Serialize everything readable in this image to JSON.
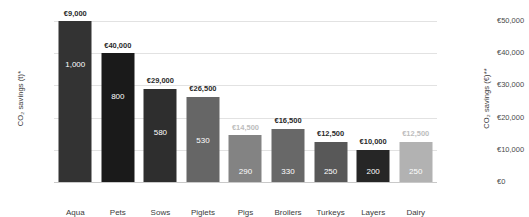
{
  "chart_data": {
    "type": "bar",
    "title": "",
    "xlabel": "",
    "ylabel": "CO₂ savings (t)*",
    "ylabel_secondary": "CO₂ savings (€)**",
    "ylim": [
      0,
      1000
    ],
    "ylim_secondary": [
      0,
      50000
    ],
    "grid": true,
    "legend": "none",
    "yticks": [
      "0",
      "200",
      "400",
      "600",
      "800",
      "1,000"
    ],
    "ytick_values": [
      0,
      200,
      400,
      600,
      800,
      1000
    ],
    "yticks_secondary": [
      "€0",
      "€10,000",
      "€20,000",
      "€30,000",
      "€40,000",
      "€50,000"
    ],
    "ytick_values_secondary": [
      0,
      10000,
      20000,
      30000,
      40000,
      50000
    ],
    "categories": [
      "Aqua",
      "Pets",
      "Sows",
      "Piglets",
      "Pigs",
      "Broilers",
      "Turkeys",
      "Layers",
      "Dairy"
    ],
    "values": [
      1000,
      800,
      580,
      530,
      290,
      330,
      250,
      200,
      250
    ],
    "value_labels": [
      "1,000",
      "800",
      "580",
      "530",
      "290",
      "330",
      "250",
      "200",
      "250"
    ],
    "euro_values": [
      9000,
      40000,
      29000,
      26500,
      14500,
      16500,
      12500,
      10000,
      12500
    ],
    "euro_labels": [
      "€9,000",
      "€40,000",
      "€29,000",
      "€26,500",
      "€14,500",
      "€16,500",
      "€12,500",
      "€10,000",
      "€12,500"
    ],
    "euro_label_faded": [
      false,
      false,
      false,
      false,
      true,
      false,
      false,
      false,
      true
    ],
    "bar_colors": [
      "#333333",
      "#1a1a1a",
      "#2e2e2e",
      "#666666",
      "#838383",
      "#686868",
      "#585858",
      "#262626",
      "#b2b2b2"
    ],
    "colors": {
      "gridline": "#e2e2e2",
      "baseline": "#c9c9c9",
      "tick_text": "#4a4a4a",
      "axis_title": "#3b3b3b",
      "value_text": "#ffffff",
      "euro_text": "#2b2b2b",
      "euro_text_faded": "#bdbdbd",
      "background": "#ffffff"
    }
  }
}
